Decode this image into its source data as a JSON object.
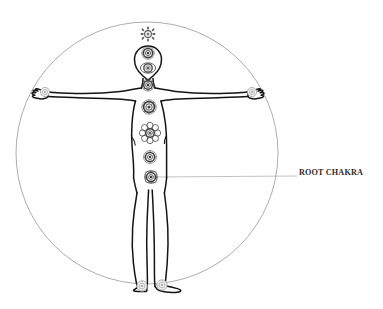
{
  "diagram": {
    "type": "anatomical-illustration",
    "background_color": "#ffffff",
    "line_color": "#1a1a1a",
    "circle_color": "#8a8a8a",
    "leader_line_color": "#a9a9a9",
    "label_color": "#2b2b2b"
  },
  "enclosing_circle": {
    "name": "vitruvian-circle",
    "center_x": 147,
    "center_y": 153,
    "radius": 131,
    "stroke_width": 0.7
  },
  "labels": [
    {
      "id": "root-chakra",
      "text": "ROOT CHAKRA",
      "x": 299,
      "y": 168,
      "leader_line": {
        "from_x": 152,
        "from_y": 177,
        "to_x": 297,
        "to_y": 176
      }
    }
  ],
  "chakras": [
    {
      "id": "crown",
      "name": "crown-chakra",
      "cx": 148,
      "cy": 34,
      "r": 7.0,
      "petals": 8,
      "style": "sun"
    },
    {
      "id": "third-eye",
      "name": "third-eye-chakra",
      "cx": 148,
      "cy": 53,
      "r": 6.2,
      "petals": 10,
      "style": "rosette"
    },
    {
      "id": "head-center",
      "name": "head-center-chakra",
      "cx": 148,
      "cy": 68,
      "r": 6.0,
      "petals": 10,
      "style": "rosette"
    },
    {
      "id": "throat",
      "name": "throat-chakra",
      "cx": 148,
      "cy": 85,
      "r": 6.0,
      "petals": 12,
      "style": "rosette"
    },
    {
      "id": "heart",
      "name": "heart-chakra",
      "cx": 149,
      "cy": 107,
      "r": 7.2,
      "petals": 12,
      "style": "rosette"
    },
    {
      "id": "solar-plexus",
      "name": "solar-plexus-chakra",
      "cx": 150,
      "cy": 133,
      "r": 8.4,
      "petals": 14,
      "style": "flower"
    },
    {
      "id": "sacral",
      "name": "sacral-chakra",
      "cx": 150,
      "cy": 157,
      "r": 6.4,
      "petals": 12,
      "style": "rosette"
    },
    {
      "id": "root",
      "name": "root-chakra",
      "cx": 151,
      "cy": 177,
      "r": 6.6,
      "petals": 8,
      "style": "rosette"
    },
    {
      "id": "hand-left",
      "name": "left-hand-chakra",
      "cx": 45,
      "cy": 92,
      "r": 4.6,
      "petals": 8,
      "style": "pale"
    },
    {
      "id": "hand-right",
      "name": "right-hand-chakra",
      "cx": 252,
      "cy": 92,
      "r": 4.6,
      "petals": 8,
      "style": "pale"
    },
    {
      "id": "foot-left",
      "name": "left-foot-chakra",
      "cx": 142,
      "cy": 286,
      "r": 5.2,
      "petals": 8,
      "style": "pale"
    },
    {
      "id": "foot-right",
      "name": "right-foot-chakra",
      "cx": 162,
      "cy": 285,
      "r": 5.2,
      "petals": 8,
      "style": "pale"
    }
  ]
}
